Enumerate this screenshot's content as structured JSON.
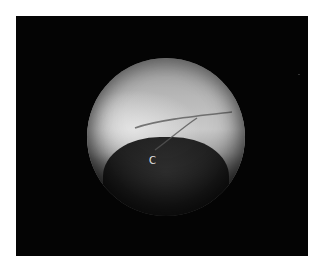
{
  "figure": {
    "label": "C",
    "colors": {
      "background": "#ffffff",
      "panel": "#040404",
      "label": "#e6e6e6"
    }
  }
}
